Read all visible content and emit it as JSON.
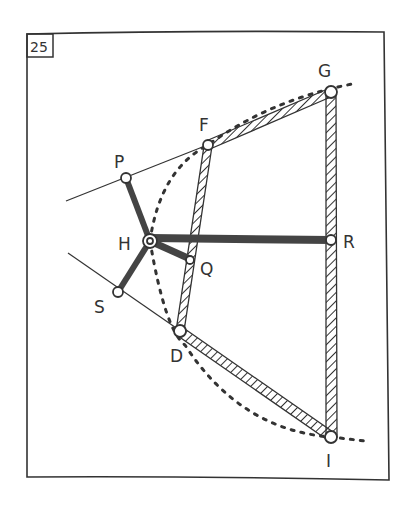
{
  "panel": {
    "number": "25"
  },
  "colors": {
    "ink": "#333333",
    "paper": "#ffffff",
    "thick_bar": "#444444"
  },
  "points": {
    "P": {
      "label": "P",
      "x": 126,
      "y": 178
    },
    "F": {
      "label": "F",
      "x": 208,
      "y": 145
    },
    "G": {
      "label": "G",
      "x": 331,
      "y": 92
    },
    "H": {
      "label": "H",
      "x": 150,
      "y": 241
    },
    "Q": {
      "label": "Q",
      "x": 190,
      "y": 260
    },
    "R": {
      "label": "R",
      "x": 331,
      "y": 240
    },
    "S": {
      "label": "S",
      "x": 118,
      "y": 292
    },
    "D": {
      "label": "D",
      "x": 180,
      "y": 331
    },
    "I": {
      "label": "I",
      "x": 331,
      "y": 437
    }
  },
  "legend": {
    "thin_lines": "guide lines through P-F and S-D",
    "hatched_bars": "F-G, G-I, D-I, F-D",
    "thick_bars": "H-P, H-S, H-Q, H-R",
    "dotted_curves": "arcs through F-G and D-I, H-D"
  }
}
